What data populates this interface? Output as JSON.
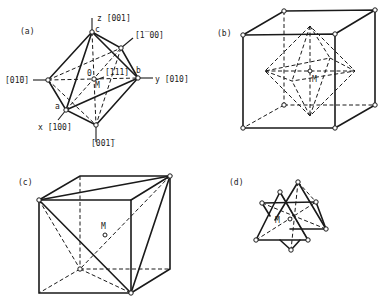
{
  "figure": {
    "panels": [
      {
        "id": "a",
        "label": "(a)",
        "description": "Octahedron with crystallographic axes",
        "axis_labels": {
          "z": "z [001]",
          "neg_x": "[̅0100]",
          "neg_y": "[0̅1̅0]",
          "y": "y [010]",
          "x": "x [100]",
          "neg_z": "[00̅1]",
          "diag": "[111]"
        },
        "vertex_labels": {
          "a": "a",
          "b": "b",
          "c": "c",
          "origin": "0",
          "center": "M"
        }
      },
      {
        "id": "b",
        "label": "(b)",
        "description": "Octahedron inscribed in cube",
        "center_label": "M"
      },
      {
        "id": "c",
        "label": "(c)",
        "description": "Tetrahedron inscribed in cube",
        "center_label": "M"
      },
      {
        "id": "d",
        "label": "(d)",
        "description": "Two interpenetrating tetrahedra",
        "center_label": "M"
      }
    ]
  },
  "labels": {
    "a_panel": "(a)",
    "b_panel": "(b)",
    "c_panel": "(c)",
    "d_panel": "(d)",
    "z_axis": "z [001]",
    "neg_x_axis": "[1̅ 00]",
    "neg_y_axis": "[01̅0]",
    "y_axis": "y [010]",
    "x_axis": "x [100]",
    "neg_z_axis": "[001̅]",
    "diag_111": "[111]",
    "vertex_a": "a",
    "vertex_b": "b",
    "vertex_c": "c",
    "origin": "0",
    "center": "M"
  }
}
